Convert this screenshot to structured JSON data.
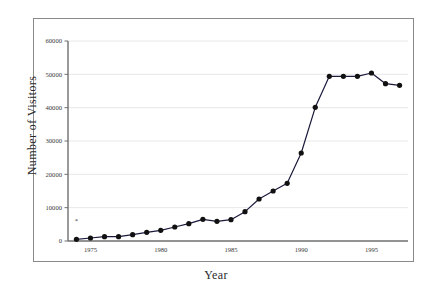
{
  "chart_data": {
    "type": "line",
    "title": "",
    "xlabel": "Year",
    "ylabel": "Number of Visitors",
    "xlim": [
      1973.4,
      1997.6
    ],
    "ylim": [
      0,
      60000
    ],
    "xticks": [
      1975,
      1980,
      1985,
      1990,
      1995
    ],
    "xticklabels": [
      "1975",
      "1980",
      "1985",
      "1990",
      "1995"
    ],
    "yticks": [
      0,
      10000,
      20000,
      30000,
      40000,
      50000,
      60000
    ],
    "yticklabels": [
      "0",
      "10000",
      "20000",
      "30000",
      "40000",
      "50000",
      "60000"
    ],
    "grid": "horizontal",
    "legend": "none",
    "marker": "filled-circle",
    "line_color": "#1a1a3c",
    "marker_color": "#111111",
    "grid_color": "#e8e8e8",
    "axis_color": "#6f6f6f",
    "annotations": [
      {
        "label": "*",
        "x": 1974,
        "y": 5300
      }
    ],
    "x": [
      1974,
      1975,
      1976,
      1977,
      1978,
      1979,
      1980,
      1981,
      1982,
      1983,
      1984,
      1985,
      1986,
      1987,
      1988,
      1989,
      1990,
      1991,
      1992,
      1993,
      1994,
      1995,
      1996,
      1997
    ],
    "values": [
      500,
      900,
      1300,
      1300,
      1900,
      2600,
      3200,
      4200,
      5200,
      6500,
      5900,
      6400,
      8800,
      12600,
      15000,
      17300,
      26400,
      40100,
      49400,
      49400,
      49400,
      50400,
      47200,
      46700
    ],
    "series": [
      {
        "name": "Number of Visitors",
        "x": [
          1974,
          1975,
          1976,
          1977,
          1978,
          1979,
          1980,
          1981,
          1982,
          1983,
          1984,
          1985,
          1986,
          1987,
          1988,
          1989,
          1990,
          1991,
          1992,
          1993,
          1994,
          1995,
          1996,
          1997
        ],
        "values": [
          500,
          900,
          1300,
          1300,
          1900,
          2600,
          3200,
          4200,
          5200,
          6500,
          5900,
          6400,
          8800,
          12600,
          15000,
          17300,
          26400,
          40100,
          49400,
          49400,
          49400,
          50400,
          47200,
          46700
        ]
      }
    ]
  },
  "axes": {
    "y_title": "Number of Visitors",
    "x_title": "Year"
  }
}
